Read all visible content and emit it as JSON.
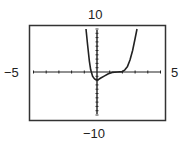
{
  "chart_data": {
    "type": "line",
    "title": "",
    "xlabel": "",
    "ylabel": "",
    "xlim": [
      -5,
      5
    ],
    "ylim": [
      -10,
      10
    ],
    "grid": false,
    "legend": null,
    "window_labels": {
      "xmin": "−5",
      "xmax": "5",
      "ymin": "−10",
      "ymax": "10"
    },
    "x_tick_step": 0.5,
    "y_tick_step": 0.5,
    "series": [
      {
        "name": "f(x)",
        "x": [
          -0.87,
          -0.75,
          -0.6,
          -0.5,
          -0.35,
          -0.2,
          0.0,
          0.1,
          0.3,
          0.6,
          0.9,
          1.2,
          1.6,
          2.0,
          2.2,
          2.4,
          2.6,
          2.8,
          3.0,
          3.15
        ],
        "y": [
          10,
          6.5,
          2.5,
          0.5,
          -1.0,
          -1.6,
          -1.8,
          -1.8,
          -1.4,
          -0.9,
          -0.4,
          -0.1,
          0.0,
          0.1,
          0.5,
          1.3,
          2.8,
          5.0,
          7.8,
          10
        ]
      }
    ]
  },
  "frame": {
    "stroke": "#333333",
    "curve_color": "#222222",
    "axis_color": "#222222"
  }
}
